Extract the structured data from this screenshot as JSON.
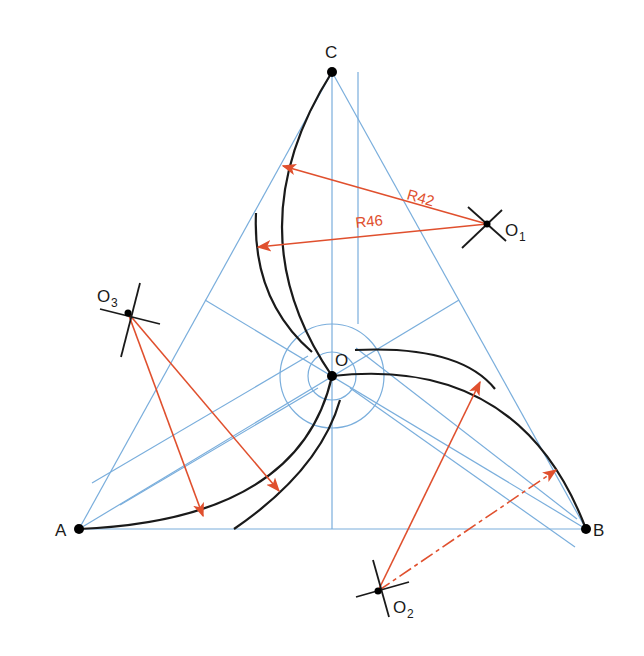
{
  "diagram": {
    "colors": {
      "construction": "#7aaedc",
      "outline": "#1a1a1a",
      "dimension": "#e0502e",
      "point": "#000000"
    },
    "points": {
      "A": {
        "label": "A",
        "x": 79,
        "y": 529
      },
      "B": {
        "label": "B",
        "x": 586,
        "y": 529
      },
      "C": {
        "label": "C",
        "x": 332,
        "y": 72
      },
      "O": {
        "label": "O",
        "x": 332,
        "y": 376
      },
      "O1": {
        "label": "O",
        "subscript": "1",
        "x": 487,
        "y": 224
      },
      "O2": {
        "label": "O",
        "subscript": "2",
        "x": 378,
        "y": 591
      },
      "O3": {
        "label": "O",
        "subscript": "3",
        "x": 128,
        "y": 313
      }
    },
    "dimensions": [
      {
        "label": "R42",
        "from": "O1"
      },
      {
        "label": "R46",
        "from": "O1"
      }
    ],
    "circles_at_O": [
      24,
      52
    ]
  }
}
